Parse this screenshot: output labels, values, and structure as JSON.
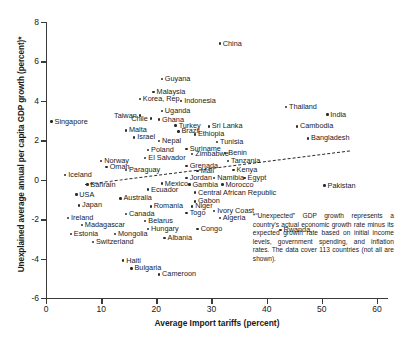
{
  "chart_data": {
    "type": "scatter",
    "title": "",
    "xlabel": "Average Import tariffs (percent)",
    "ylabel": "Unexplained average annual per capita GDP growth (percent)*",
    "xlim": [
      0,
      62
    ],
    "ylim": [
      -6,
      8
    ],
    "xticks": [
      0,
      10,
      20,
      30,
      40,
      50,
      60
    ],
    "yticks": [
      -6,
      -4,
      -2,
      0,
      2,
      4,
      6,
      8
    ],
    "grid": false,
    "legend": null,
    "trendline": {
      "type": "dashed-linear",
      "x0": 7,
      "y0": -0.2,
      "x1": 55,
      "y1": 1.5
    },
    "footnote": "*“Unexpected” GDP growth represents a country's actual economic growth rate minus its expected growth rate based on initial income levels, government spending, and inflation rates. The data cover 113 countries (not all are shown).",
    "points": [
      {
        "label": "China",
        "x": 31.5,
        "y": 6.9,
        "pos": "r"
      },
      {
        "label": "Guyana",
        "x": 21.0,
        "y": 5.1,
        "pos": "r"
      },
      {
        "label": "Malaysia",
        "x": 19.5,
        "y": 4.45,
        "pos": "r"
      },
      {
        "label": "Korea, Rep.",
        "x": 17.0,
        "y": 4.1,
        "pos": "r"
      },
      {
        "label": "Indonesia",
        "x": 24.5,
        "y": 4.0,
        "pos": "r"
      },
      {
        "label": "Thailand",
        "x": 43.5,
        "y": 3.7,
        "pos": "r"
      },
      {
        "label": "Uganda",
        "x": 21.0,
        "y": 3.5,
        "pos": "r"
      },
      {
        "label": "Taiwan",
        "x": 17.0,
        "y": 3.25,
        "pos": "l"
      },
      {
        "label": "Chile",
        "x": 19.0,
        "y": 3.1,
        "pos": "l"
      },
      {
        "label": "Ghana",
        "x": 20.5,
        "y": 3.05,
        "pos": "r"
      },
      {
        "label": "Singapore",
        "x": 1.0,
        "y": 2.95,
        "pos": "r"
      },
      {
        "label": "India",
        "x": 51.0,
        "y": 3.3,
        "pos": "r"
      },
      {
        "label": "Turkey",
        "x": 23.5,
        "y": 2.75,
        "pos": "r"
      },
      {
        "label": "Sri Lanka",
        "x": 29.5,
        "y": 2.7,
        "pos": "r"
      },
      {
        "label": "Cambodia",
        "x": 45.5,
        "y": 2.7,
        "pos": "r"
      },
      {
        "label": "Malta",
        "x": 14.5,
        "y": 2.5,
        "pos": "r"
      },
      {
        "label": "Brazil",
        "x": 24.0,
        "y": 2.45,
        "pos": "r"
      },
      {
        "label": "Ethiopia",
        "x": 27.0,
        "y": 2.3,
        "pos": "r"
      },
      {
        "label": "Israel",
        "x": 16.0,
        "y": 2.15,
        "pos": "r"
      },
      {
        "label": "Bangladesh",
        "x": 47.5,
        "y": 2.1,
        "pos": "r"
      },
      {
        "label": "Nepal",
        "x": 20.5,
        "y": 1.95,
        "pos": "r"
      },
      {
        "label": "Tunisia",
        "x": 31.0,
        "y": 1.9,
        "pos": "r"
      },
      {
        "label": "Suriname",
        "x": 25.5,
        "y": 1.55,
        "pos": "r"
      },
      {
        "label": "Poland",
        "x": 18.5,
        "y": 1.5,
        "pos": "r"
      },
      {
        "label": "Zimbabwe",
        "x": 26.5,
        "y": 1.3,
        "pos": "r"
      },
      {
        "label": "Benin",
        "x": 32.5,
        "y": 1.35,
        "pos": "r"
      },
      {
        "label": "El Salvador",
        "x": 18.0,
        "y": 1.1,
        "pos": "r"
      },
      {
        "label": "Norway",
        "x": 10.0,
        "y": 0.95,
        "pos": "r"
      },
      {
        "label": "Tanzania",
        "x": 33.0,
        "y": 0.95,
        "pos": "r"
      },
      {
        "label": "Grenada",
        "x": 25.5,
        "y": 0.7,
        "pos": "r"
      },
      {
        "label": "Oman",
        "x": 11.0,
        "y": 0.65,
        "pos": "r"
      },
      {
        "label": "Paraguay",
        "x": 14.5,
        "y": 0.5,
        "pos": "r"
      },
      {
        "label": "Mali",
        "x": 27.5,
        "y": 0.45,
        "pos": "r"
      },
      {
        "label": "Kenya",
        "x": 34.0,
        "y": 0.5,
        "pos": "r"
      },
      {
        "label": "Iceland",
        "x": 3.5,
        "y": 0.25,
        "pos": "r"
      },
      {
        "label": "Jordan",
        "x": 25.5,
        "y": 0.1,
        "pos": "r"
      },
      {
        "label": "Namibia",
        "x": 30.5,
        "y": 0.1,
        "pos": "r"
      },
      {
        "label": "Egypt",
        "x": 36.0,
        "y": 0.1,
        "pos": "r"
      },
      {
        "label": "Bahrain",
        "x": 7.5,
        "y": -0.25,
        "pos": "r"
      },
      {
        "label": "Mexico",
        "x": 21.0,
        "y": -0.2,
        "pos": "r"
      },
      {
        "label": "Gambia",
        "x": 26.0,
        "y": -0.25,
        "pos": "r"
      },
      {
        "label": "Morocco",
        "x": 32.0,
        "y": -0.25,
        "pos": "r"
      },
      {
        "label": "Ecuador",
        "x": 18.5,
        "y": -0.5,
        "pos": "r"
      },
      {
        "label": "USA",
        "x": 5.5,
        "y": -0.75,
        "pos": "r"
      },
      {
        "label": "Central African Republic",
        "x": 27.0,
        "y": -0.65,
        "pos": "r"
      },
      {
        "label": "Australia",
        "x": 13.5,
        "y": -0.95,
        "pos": "r"
      },
      {
        "label": "Gabon",
        "x": 27.0,
        "y": -1.1,
        "pos": "r"
      },
      {
        "label": "Japan",
        "x": 6.0,
        "y": -1.3,
        "pos": "r"
      },
      {
        "label": "Romania",
        "x": 19.0,
        "y": -1.35,
        "pos": "r"
      },
      {
        "label": "Niger",
        "x": 26.5,
        "y": -1.35,
        "pos": "r"
      },
      {
        "label": "Togo",
        "x": 25.5,
        "y": -1.7,
        "pos": "r"
      },
      {
        "label": "Ivory Coast",
        "x": 30.5,
        "y": -1.6,
        "pos": "r"
      },
      {
        "label": "Canada",
        "x": 14.5,
        "y": -1.75,
        "pos": "r"
      },
      {
        "label": "Ireland",
        "x": 4.0,
        "y": -1.95,
        "pos": "r"
      },
      {
        "label": "Algeria",
        "x": 31.5,
        "y": -1.95,
        "pos": "r"
      },
      {
        "label": "Belarus",
        "x": 18.0,
        "y": -2.1,
        "pos": "r"
      },
      {
        "label": "Madagascar",
        "x": 6.5,
        "y": -2.3,
        "pos": "r"
      },
      {
        "label": "Hungary",
        "x": 18.5,
        "y": -2.5,
        "pos": "r"
      },
      {
        "label": "Congo",
        "x": 27.5,
        "y": -2.5,
        "pos": "r"
      },
      {
        "label": "Estonia",
        "x": 4.5,
        "y": -2.75,
        "pos": "r"
      },
      {
        "label": "Mongolia",
        "x": 12.5,
        "y": -2.75,
        "pos": "r"
      },
      {
        "label": "Albania",
        "x": 21.5,
        "y": -2.95,
        "pos": "r"
      },
      {
        "label": "Switzerland",
        "x": 8.5,
        "y": -3.15,
        "pos": "r"
      },
      {
        "label": "Haiti",
        "x": 14.0,
        "y": -4.1,
        "pos": "r"
      },
      {
        "label": "Bulgaria",
        "x": 15.5,
        "y": -4.5,
        "pos": "r"
      },
      {
        "label": "Cameroon",
        "x": 20.5,
        "y": -4.8,
        "pos": "r"
      },
      {
        "label": "Pakistan",
        "x": 50.5,
        "y": -0.3,
        "pos": "r"
      },
      {
        "label": "Rwanda",
        "x": 42.5,
        "y": -2.55,
        "pos": "r"
      }
    ]
  }
}
